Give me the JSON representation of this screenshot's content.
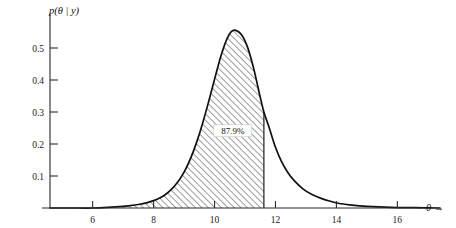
{
  "chart_data": {
    "type": "area",
    "title": "",
    "subtitle": "",
    "xlabel": "θ →",
    "ylabel": "p(θ | y)",
    "xlim": [
      4.6,
      17.4
    ],
    "ylim": [
      0,
      0.6
    ],
    "grid": false,
    "legend": null,
    "x_ticks": [
      6,
      8,
      10,
      12,
      14,
      16
    ],
    "x_tick_labels": [
      "6",
      "8",
      "10",
      "12",
      "14",
      "16"
    ],
    "y_ticks": [
      0.1,
      0.2,
      0.3,
      0.4,
      0.5
    ],
    "y_tick_labels": [
      "0.1",
      "0.2",
      "0.3",
      "0.4",
      "0.5"
    ],
    "annotations": [
      {
        "text": "87.9%",
        "x": 10.6,
        "y": 0.235,
        "kind": "shaded-area-probability-label"
      }
    ],
    "shaded_region": {
      "fill": "hatched-diagonal",
      "x_start": 7.2,
      "x_end": 11.62,
      "probability_pct": 87.9,
      "right_edge_is_vertical_cut": true
    },
    "curve": {
      "name": "posterior density p(θ|y)",
      "peak_x": 10.55,
      "peak_y": 0.555,
      "x": [
        4.6,
        5.5,
        6.0,
        6.5,
        7.0,
        7.2,
        7.5,
        7.8,
        8.0,
        8.2,
        8.4,
        8.6,
        8.8,
        9.0,
        9.2,
        9.4,
        9.6,
        9.8,
        10.0,
        10.2,
        10.4,
        10.55,
        10.7,
        10.9,
        11.1,
        11.3,
        11.5,
        11.62,
        11.8,
        12.0,
        12.2,
        12.4,
        12.6,
        12.9,
        13.2,
        13.5,
        13.8,
        14.1,
        14.5,
        15.0,
        15.8,
        16.6,
        17.4
      ],
      "y": [
        0.0,
        0.0,
        0.0,
        0.002,
        0.005,
        0.007,
        0.011,
        0.017,
        0.023,
        0.031,
        0.043,
        0.06,
        0.082,
        0.112,
        0.152,
        0.202,
        0.262,
        0.33,
        0.402,
        0.472,
        0.527,
        0.551,
        0.555,
        0.54,
        0.498,
        0.43,
        0.346,
        0.3,
        0.249,
        0.19,
        0.145,
        0.112,
        0.087,
        0.06,
        0.042,
        0.03,
        0.021,
        0.014,
        0.009,
        0.005,
        0.002,
        0.001,
        0.0
      ]
    }
  },
  "axes": {
    "y_axis_title": "p(θ | y)",
    "x_axis_title": "θ →",
    "x_tick_labels": [
      "6",
      "8",
      "10",
      "12",
      "14",
      "16"
    ],
    "y_tick_labels": [
      "0.1",
      "0.2",
      "0.3",
      "0.4",
      "0.5"
    ]
  },
  "annotation": {
    "probability_label": "87.9%"
  },
  "colors": {
    "axis": "#2b2b2b",
    "curve": "#111111",
    "hatch": "#5a5a5a",
    "text": "#1a1a1a",
    "background": "#ffffff"
  }
}
